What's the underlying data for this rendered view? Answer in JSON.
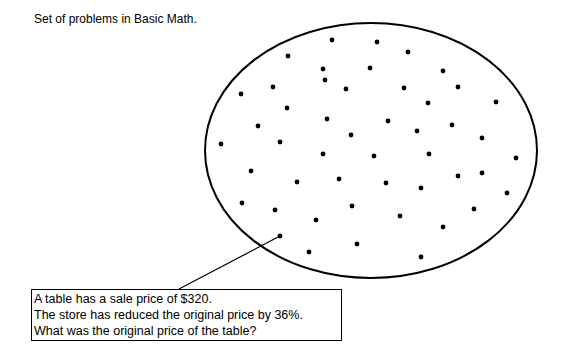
{
  "title": "Set of problems in Basic Math.",
  "set": {
    "ellipse": {
      "cx": 371,
      "cy": 150.5,
      "rx": 166,
      "ry": 127.5,
      "stroke": "#000000",
      "stroke_width": 2
    },
    "dot_radius": 2.4,
    "dots": [
      [
        332,
        40
      ],
      [
        377,
        42
      ],
      [
        408,
        52
      ],
      [
        288,
        56
      ],
      [
        323,
        69
      ],
      [
        370,
        68
      ],
      [
        443,
        71
      ],
      [
        325,
        80
      ],
      [
        346,
        89
      ],
      [
        273,
        87
      ],
      [
        241,
        94
      ],
      [
        404,
        88
      ],
      [
        458,
        87
      ],
      [
        428,
        103
      ],
      [
        287,
        108
      ],
      [
        496,
        102
      ],
      [
        327,
        119
      ],
      [
        388,
        121
      ],
      [
        452,
        125
      ],
      [
        258,
        126
      ],
      [
        417,
        131
      ],
      [
        351,
        135
      ],
      [
        482,
        138
      ],
      [
        221,
        144
      ],
      [
        280,
        142
      ],
      [
        323,
        154
      ],
      [
        374,
        156
      ],
      [
        429,
        154
      ],
      [
        516,
        158
      ],
      [
        251,
        171
      ],
      [
        458,
        176
      ],
      [
        482,
        173
      ],
      [
        339,
        179
      ],
      [
        297,
        182
      ],
      [
        386,
        183
      ],
      [
        421,
        188
      ],
      [
        507,
        193
      ],
      [
        242,
        203
      ],
      [
        352,
        206
      ],
      [
        474,
        209
      ],
      [
        275,
        210
      ],
      [
        316,
        220
      ],
      [
        400,
        216
      ],
      [
        443,
        227
      ],
      [
        280,
        236
      ],
      [
        357,
        244
      ],
      [
        309,
        252
      ],
      [
        421,
        257
      ]
    ]
  },
  "leader": {
    "from": [
      280,
      236
    ],
    "to": [
      179,
      289
    ]
  },
  "callout": {
    "lines": [
      "A table has a sale price of $320.",
      "The store has reduced the original price by 36%.",
      "What was the original price of the table?"
    ]
  }
}
